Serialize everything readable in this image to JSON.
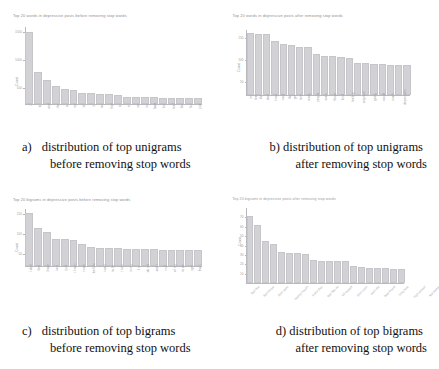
{
  "figure": {
    "panels": [
      {
        "key": "a",
        "caption_marker": "a)",
        "caption_line1": "distribution of top unigrams",
        "caption_line2": "before removing stop words"
      },
      {
        "key": "b",
        "caption_marker": "b)",
        "caption_line1": "distribution of top unigrams",
        "caption_line2": "after removing stop words"
      },
      {
        "key": "c",
        "caption_marker": "c)",
        "caption_line1": "distribution of top bigrams",
        "caption_line2": "before removing stop words"
      },
      {
        "key": "d",
        "caption_marker": "d)",
        "caption_line1": "distribution of top bigrams",
        "caption_line2": "after removing stop words"
      }
    ]
  },
  "chart_data": [
    {
      "id": "unigrams-before",
      "type": "bar",
      "title": "Top 20 words in depressive posts before removing stop words",
      "xlabel": "",
      "ylabel": "Count",
      "ylim": [
        0,
        1700
      ],
      "yticks": [
        500,
        1000,
        1500
      ],
      "ytick_labels": [
        "500",
        "1000",
        "1500"
      ],
      "grid": false,
      "legend": "none",
      "orientation": "vertical",
      "categories": [
        "i",
        "to",
        "and",
        "the",
        "a",
        "my",
        "of",
        "it",
        "me",
        "that",
        "is",
        "in",
        "so",
        "im",
        "have",
        "but",
        "feel",
        "like",
        "for",
        "just"
      ],
      "values": [
        1600,
        700,
        520,
        400,
        330,
        320,
        250,
        235,
        225,
        215,
        195,
        160,
        150,
        150,
        145,
        140,
        135,
        132,
        130,
        128
      ]
    },
    {
      "id": "unigrams-after",
      "type": "bar",
      "title": "Top 20 words in depressive posts after removing stop words",
      "xlabel": "",
      "ylabel": "Count",
      "ylim": [
        0,
        160
      ],
      "yticks": [
        50,
        100,
        150
      ],
      "ytick_labels": [
        "50",
        "100",
        "150"
      ],
      "grid": false,
      "legend": "none",
      "orientation": "vertical",
      "categories": [
        "im",
        "feel",
        "like",
        "dont",
        "know",
        "want",
        "life",
        "get",
        "time",
        "really",
        "people",
        "even",
        "things",
        "think",
        "feeling",
        "anymore",
        "going",
        "would",
        "much",
        "depression"
      ],
      "values": [
        152,
        150,
        149,
        132,
        125,
        122,
        119,
        118,
        100,
        97,
        95,
        94,
        92,
        80,
        78,
        77,
        76,
        74,
        73,
        73
      ]
    },
    {
      "id": "bigrams-before",
      "type": "bar",
      "title": "Top 20 bigrams in depressive posts before removing stop words",
      "xlabel": "",
      "ylabel": "Count",
      "ylim": [
        0,
        180
      ],
      "yticks": [
        50,
        100,
        150
      ],
      "ytick_labels": [
        "50",
        "100",
        "150"
      ],
      "grid": false,
      "legend": "none",
      "orientation": "vertical",
      "categories": [
        "i dont",
        "i feel",
        "i have",
        "i am",
        "i just",
        "i know",
        "i want",
        "feel like",
        "i cant",
        "to be",
        "i was",
        "in my",
        "it is",
        "do not",
        "and i",
        "i will",
        "of my",
        "to do",
        "i get",
        "that i"
      ],
      "values": [
        168,
        120,
        108,
        85,
        85,
        83,
        68,
        60,
        58,
        57,
        56,
        55,
        54,
        54,
        53,
        52,
        52,
        51,
        50,
        50
      ]
    },
    {
      "id": "bigrams-after",
      "type": "bar",
      "title": "Top 20 bigrams in depressive posts after removing stop words",
      "xlabel": "",
      "ylabel": "Count",
      "ylim": [
        0,
        80
      ],
      "yticks": [
        10,
        20,
        30,
        40,
        50,
        60,
        70
      ],
      "ytick_labels": [
        "10",
        "20",
        "30",
        "40",
        "50",
        "60",
        "70"
      ],
      "grid": false,
      "legend": "none",
      "orientation": "vertical",
      "categories": [
        "feel like",
        "dont know",
        "dont want",
        "mental health",
        "every day",
        "feel like im",
        "kill myself",
        "dont even",
        "want die",
        "best friend",
        "long time",
        "high school",
        "feel better",
        "dont feel",
        "never been",
        "im tired",
        "even know",
        "last year",
        "make feel",
        "something else"
      ],
      "values": [
        72,
        62,
        45,
        42,
        33,
        32,
        32,
        31,
        25,
        24,
        24,
        23,
        23,
        18,
        17,
        16,
        16,
        16,
        15,
        15
      ]
    }
  ]
}
